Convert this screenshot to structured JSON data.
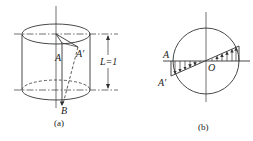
{
  "figure": {
    "panel_a": {
      "caption": "(a)",
      "labels": {
        "A": "A",
        "A_prime": "A′",
        "B": "B",
        "length": "L=1"
      },
      "description": "Cylinder with vertical axis; generatrix AB rotated to A'B (dashed) after torsion"
    },
    "panel_b": {
      "caption": "(b)",
      "labels": {
        "A": "A",
        "A_prime": "A′",
        "O": "O"
      },
      "description": "Circular cross-section with linear shear displacement distribution (hatched triangles with arrows) across diameter through O"
    }
  },
  "colors": {
    "stroke": "#333333",
    "background": "#ffffff"
  }
}
